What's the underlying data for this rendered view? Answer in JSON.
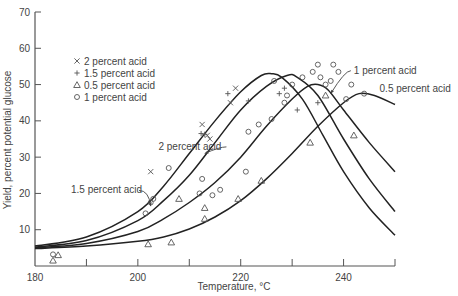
{
  "chart_data": {
    "type": "scatter",
    "title": "",
    "xlabel": "Temperature, °C",
    "ylabel": "Yield, percent potential glucose",
    "xlim": [
      180,
      250
    ],
    "ylim": [
      0,
      70
    ],
    "xticks": [
      180,
      190,
      200,
      210,
      220,
      230,
      240,
      250
    ],
    "xtick_labels": [
      "180",
      "",
      "200",
      "",
      "220",
      "",
      "240",
      ""
    ],
    "yticks": [
      10,
      20,
      30,
      40,
      50,
      60,
      70
    ],
    "ytick_labels": [
      "10",
      "20",
      "30",
      "40",
      "50",
      "60",
      "70"
    ],
    "grid": false,
    "legend_position": "upper-left",
    "legend": [
      {
        "marker": "x",
        "symbol": "×",
        "label": "2 percent acid"
      },
      {
        "marker": "plus",
        "symbol": "+",
        "label": "1.5 percent acid"
      },
      {
        "marker": "triangle",
        "symbol": "△",
        "label": "0.5 percent acid"
      },
      {
        "marker": "circle",
        "symbol": "○",
        "label": "1 percent acid"
      }
    ],
    "series": [
      {
        "name": "2 percent acid",
        "marker": "x",
        "points": [
          [
            202.5,
            26
          ],
          [
            212.5,
            39
          ],
          [
            213.5,
            36
          ],
          [
            214,
            35
          ],
          [
            219,
            49
          ],
          [
            218,
            45
          ]
        ],
        "fit_curve": [
          [
            180,
            5.5
          ],
          [
            190,
            8
          ],
          [
            200,
            15
          ],
          [
            205,
            22
          ],
          [
            210,
            31
          ],
          [
            215,
            40
          ],
          [
            220,
            48
          ],
          [
            224,
            52.5
          ],
          [
            226,
            53
          ],
          [
            228,
            52
          ],
          [
            232,
            46
          ],
          [
            236,
            36
          ],
          [
            240,
            26
          ],
          [
            245,
            16
          ],
          [
            250,
            8.5
          ]
        ]
      },
      {
        "name": "1.5 percent acid",
        "marker": "plus",
        "points": [
          [
            212.3,
            36.5
          ],
          [
            213,
            36.3
          ],
          [
            217.5,
            47.5
          ],
          [
            221.5,
            45.5
          ],
          [
            227.5,
            47.5
          ],
          [
            228.5,
            49
          ],
          [
            231,
            43
          ],
          [
            235,
            45
          ]
        ],
        "fit_curve": [
          [
            180,
            5.2
          ],
          [
            190,
            7
          ],
          [
            200,
            12.5
          ],
          [
            205,
            18
          ],
          [
            210,
            25
          ],
          [
            215,
            34
          ],
          [
            220,
            43
          ],
          [
            225,
            49.5
          ],
          [
            229,
            52.5
          ],
          [
            231,
            52
          ],
          [
            235,
            47
          ],
          [
            240,
            35
          ],
          [
            245,
            24
          ],
          [
            250,
            15
          ]
        ]
      },
      {
        "name": "1 percent acid",
        "marker": "circle",
        "points": [
          [
            183.5,
            3.2
          ],
          [
            201.5,
            14.5
          ],
          [
            202.5,
            17.5
          ],
          [
            203,
            18.5
          ],
          [
            206,
            27
          ],
          [
            212,
            20
          ],
          [
            212.5,
            24
          ],
          [
            214.5,
            19.5
          ],
          [
            216,
            21
          ],
          [
            221,
            26
          ],
          [
            221.5,
            37
          ],
          [
            223.5,
            39
          ],
          [
            226,
            40.5
          ],
          [
            226.5,
            51
          ],
          [
            228.5,
            45
          ],
          [
            229,
            47
          ],
          [
            230,
            50
          ],
          [
            232,
            52
          ],
          [
            234,
            53.5
          ],
          [
            235,
            55.5
          ],
          [
            235.5,
            52
          ],
          [
            236.5,
            50
          ],
          [
            237.5,
            51
          ],
          [
            238,
            55.5
          ],
          [
            239,
            53.5
          ],
          [
            240.5,
            46
          ],
          [
            241.5,
            50
          ],
          [
            244,
            47.5
          ]
        ],
        "fit_curve": [
          [
            180,
            5.0
          ],
          [
            190,
            6.2
          ],
          [
            200,
            9.5
          ],
          [
            205,
            13
          ],
          [
            210,
            17.5
          ],
          [
            215,
            23
          ],
          [
            220,
            30
          ],
          [
            225,
            38.5
          ],
          [
            230,
            46
          ],
          [
            233,
            49.5
          ],
          [
            235,
            50
          ],
          [
            237,
            48.5
          ],
          [
            240,
            43
          ],
          [
            245,
            34
          ],
          [
            250,
            26
          ]
        ]
      },
      {
        "name": "0.5 percent acid",
        "marker": "triangle",
        "points": [
          [
            183.5,
            1.5
          ],
          [
            184.5,
            3
          ],
          [
            202,
            6
          ],
          [
            206.5,
            6.5
          ],
          [
            208,
            18.5
          ],
          [
            213,
            13
          ],
          [
            213,
            16
          ],
          [
            219.5,
            18.5
          ],
          [
            224,
            23.5
          ],
          [
            233.5,
            34
          ],
          [
            236.5,
            47
          ],
          [
            242,
            36
          ]
        ],
        "fit_curve": [
          [
            180,
            4.8
          ],
          [
            190,
            5.5
          ],
          [
            200,
            6.8
          ],
          [
            205,
            8
          ],
          [
            210,
            10.2
          ],
          [
            215,
            13.5
          ],
          [
            220,
            18
          ],
          [
            225,
            24
          ],
          [
            230,
            31
          ],
          [
            235,
            38.5
          ],
          [
            240,
            45
          ],
          [
            243,
            47.5
          ],
          [
            246,
            47
          ],
          [
            250,
            44.5
          ]
        ]
      }
    ],
    "annotations": [
      {
        "text": "2 percent acid",
        "x": 204,
        "y": 32,
        "arrow_to": [
          213,
          31
        ]
      },
      {
        "text": "1.5 percent acid",
        "x": 187,
        "y": 20,
        "arrow_to": [
          202.5,
          16.5
        ]
      },
      {
        "text": "1 percent acid",
        "x": 242,
        "y": 53,
        "arrow_to": [
          237.5,
          47.5
        ]
      },
      {
        "text": "0.5 percent acid",
        "x": 247,
        "y": 48,
        "arrow_to": null
      }
    ]
  }
}
